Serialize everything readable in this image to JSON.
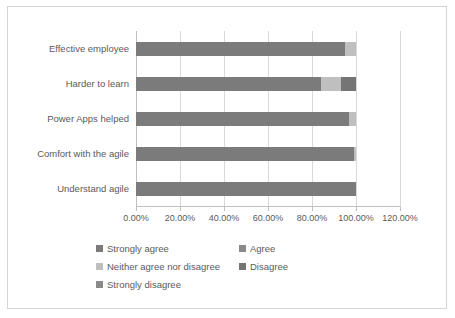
{
  "chart_data": {
    "type": "bar",
    "orientation": "horizontal",
    "stacked": true,
    "title": "",
    "xlabel": "",
    "ylabel": "",
    "grid": true,
    "legend_position": "bottom",
    "xlim": [
      0,
      120
    ],
    "xticks": [
      0,
      20,
      40,
      60,
      80,
      100,
      120
    ],
    "xticklabels": [
      "0.00%",
      "20.00%",
      "40.00%",
      "60.00%",
      "80.00%",
      "100.00%",
      "120.00%"
    ],
    "categories": [
      "Effective employee",
      "Harder to learn",
      "Power Apps helped",
      "Comfort with the agile",
      "Understand agile"
    ],
    "series": [
      {
        "name": "Strongly agree",
        "color": "#7b7b7b",
        "values": [
          95.0,
          84.0,
          97.0,
          99.0,
          100.0
        ]
      },
      {
        "name": "Agree",
        "color": "#898989",
        "values": [
          0.0,
          0.0,
          0.0,
          0.0,
          0.0
        ]
      },
      {
        "name": "Neither agree nor disagree",
        "color": "#bfbfbf",
        "values": [
          5.0,
          9.0,
          3.0,
          1.0,
          0.0
        ]
      },
      {
        "name": "Disagree",
        "color": "#757575",
        "values": [
          0.0,
          7.0,
          0.0,
          0.0,
          0.0
        ]
      },
      {
        "name": "Strongly disagree",
        "color": "#8a8a8a",
        "values": [
          0.0,
          0.0,
          0.0,
          0.0,
          0.0
        ]
      }
    ]
  },
  "legend": {
    "entries": [
      {
        "label": "Strongly agree",
        "color": "#7b7b7b"
      },
      {
        "label": "Agree",
        "color": "#898989"
      },
      {
        "label": "Neither agree nor disagree",
        "color": "#bfbfbf"
      },
      {
        "label": "Disagree",
        "color": "#757575"
      },
      {
        "label": "Strongly disagree",
        "color": "#8a8a8a"
      }
    ]
  },
  "style": {
    "plot_background": "#ffffff",
    "border_color": "#d4d4d4",
    "gridline_color": "#d9d9d9",
    "axis_color": "#bfbfbf",
    "text_color": "#5a5a5a"
  }
}
